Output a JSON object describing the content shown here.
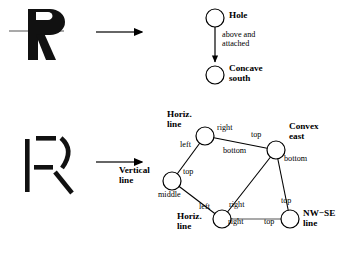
{
  "figure": {
    "background_color": "#ffffff",
    "ink_color": "#000000",
    "faint_line_color": "#8c8c8c",
    "width": 361,
    "height": 257
  },
  "rows": [
    {
      "id": "row-hole",
      "source_glyph": {
        "name": "letter-r-solid",
        "character": "R",
        "description": "solid bold letter R with a faint horizontal rule crossing it"
      },
      "arrow": {
        "name": "maps-to-arrow",
        "direction": "right"
      },
      "graph": {
        "type": "directed",
        "nodes": [
          {
            "id": "hole",
            "label": "Hole",
            "cx": 215,
            "cy": 18,
            "r": 9,
            "label_x": 230,
            "label_y": 12
          },
          {
            "id": "concave-south",
            "label": "Concave\nsouth",
            "cx": 215,
            "cy": 75,
            "r": 9,
            "label_x": 230,
            "label_y": 66
          }
        ],
        "edges": [
          {
            "from": "hole",
            "to": "concave-south",
            "label": "above and\nattached",
            "label_x": 222,
            "label_y": 34,
            "directed": true,
            "color": "#000000"
          }
        ]
      }
    },
    {
      "id": "row-strokes",
      "source_glyph": {
        "name": "letter-r-fragmented",
        "character": "R",
        "description": "letter R broken into separate strokes: vertical bar, two horizontal bars, convex arc, diagonal"
      },
      "arrow": {
        "name": "maps-to-arrow",
        "direction": "right"
      },
      "graph": {
        "type": "undirected",
        "nodes": [
          {
            "id": "horiz-line-top",
            "label": "Horiz.\nline",
            "cx": 205,
            "cy": 136,
            "r": 9,
            "label_x": 167,
            "label_y": 112,
            "label_align": "left"
          },
          {
            "id": "convex-east",
            "label": "Convex\neast",
            "cx": 276,
            "cy": 150,
            "r": 9,
            "label_x": 290,
            "label_y": 124,
            "label_align": "left"
          },
          {
            "id": "vertical-line",
            "label": "Vertical\nline",
            "cx": 172,
            "cy": 181,
            "r": 9,
            "label_x": 120,
            "label_y": 168,
            "label_align": "left"
          },
          {
            "id": "horiz-line-bottom",
            "label": "Horiz.\nline",
            "cx": 222,
            "cy": 219,
            "r": 9,
            "label_x": 178,
            "label_y": 214,
            "label_align": "left"
          },
          {
            "id": "nw-se-line",
            "label": "NW−SE\nline",
            "cx": 290,
            "cy": 219,
            "r": 9,
            "label_x": 304,
            "label_y": 211,
            "label_align": "left"
          }
        ],
        "edges": [
          {
            "id": "e1",
            "from": "horiz-line-top",
            "to": "convex-east",
            "color": "#000000",
            "endpoint_labels": [
              {
                "text": "right",
                "x": 217,
                "y": 127
              },
              {
                "text": "top",
                "x": 252,
                "y": 134
              }
            ]
          },
          {
            "id": "e2",
            "from": "horiz-line-top",
            "to": "vertical-line",
            "color": "#000000",
            "endpoint_labels": [
              {
                "text": "left",
                "x": 181,
                "y": 143
              },
              {
                "text": "top",
                "x": 184,
                "y": 170
              }
            ]
          },
          {
            "id": "e3",
            "from": "convex-east",
            "to": "horiz-line-bottom",
            "color": "#000000",
            "endpoint_labels": [
              {
                "text": "bottom",
                "x": 225,
                "y": 150
              },
              {
                "text": "right",
                "x": 230,
                "y": 204
              }
            ]
          },
          {
            "id": "e4",
            "from": "convex-east",
            "to": "nw-se-line",
            "color": "#000000",
            "endpoint_labels": [
              {
                "text": "bottom",
                "x": 285,
                "y": 157
              },
              {
                "text": "top",
                "x": 282,
                "y": 200
              }
            ]
          },
          {
            "id": "e5",
            "from": "vertical-line",
            "to": "horiz-line-bottom",
            "color": "#000000",
            "endpoint_labels": [
              {
                "text": "middle",
                "x": 161,
                "y": 194
              },
              {
                "text": "left",
                "x": 200,
                "y": 206
              }
            ]
          },
          {
            "id": "e6",
            "from": "horiz-line-bottom",
            "to": "nw-se-line",
            "color": "#8c8c8c",
            "endpoint_labels": [
              {
                "text": "right",
                "x": 229,
                "y": 221
              },
              {
                "text": "top",
                "x": 265,
                "y": 221
              }
            ]
          }
        ]
      }
    }
  ]
}
